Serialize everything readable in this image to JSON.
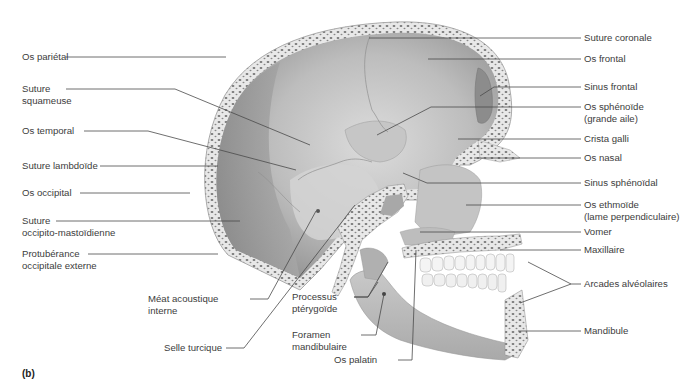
{
  "figure": {
    "panel_label": "(b)"
  },
  "labels_left": [
    {
      "id": "os-parietal",
      "lines": [
        "Os pariétal"
      ]
    },
    {
      "id": "suture-squameuse",
      "lines": [
        "Suture",
        "squameuse"
      ]
    },
    {
      "id": "os-temporal",
      "lines": [
        "Os temporal"
      ]
    },
    {
      "id": "suture-lambdoide",
      "lines": [
        "Suture lambdoïde"
      ]
    },
    {
      "id": "os-occipital",
      "lines": [
        "Os occipital"
      ]
    },
    {
      "id": "suture-occipito-mastoidienne",
      "lines": [
        "Suture",
        "occipito-mastoïdienne"
      ]
    },
    {
      "id": "protuberance-occipitale-externe",
      "lines": [
        "Protubérance",
        "occipitale externe"
      ]
    }
  ],
  "labels_bottom": [
    {
      "id": "meat-acoustique-interne",
      "lines": [
        "Méat acoustique",
        "interne"
      ]
    },
    {
      "id": "selle-turcique",
      "lines": [
        "Selle turcique"
      ]
    },
    {
      "id": "processus-pterygoide",
      "lines": [
        "Processus",
        "ptérygoïde"
      ]
    },
    {
      "id": "foramen-mandibulaire",
      "lines": [
        "Foramen",
        "mandibulaire"
      ]
    },
    {
      "id": "os-palatin",
      "lines": [
        "Os palatin"
      ]
    }
  ],
  "labels_right": [
    {
      "id": "suture-coronale",
      "lines": [
        "Suture coronale"
      ]
    },
    {
      "id": "os-frontal",
      "lines": [
        "Os frontal"
      ]
    },
    {
      "id": "sinus-frontal",
      "lines": [
        "Sinus frontal"
      ]
    },
    {
      "id": "os-sphenoide",
      "lines": [
        "Os sphénoïde",
        "(grande aile)"
      ]
    },
    {
      "id": "crista-galli",
      "lines": [
        "Crista galli"
      ]
    },
    {
      "id": "os-nasal",
      "lines": [
        "Os nasal"
      ]
    },
    {
      "id": "sinus-sphenoidal",
      "lines": [
        "Sinus sphénoïdal"
      ]
    },
    {
      "id": "os-ethmoide",
      "lines": [
        "Os ethmoïde",
        "(lame perpendiculaire)"
      ]
    },
    {
      "id": "vomer",
      "lines": [
        "Vomer"
      ]
    },
    {
      "id": "maxillaire",
      "lines": [
        "Maxillaire"
      ]
    },
    {
      "id": "arcades-alveolaires",
      "lines": [
        "Arcades alvéolaires"
      ]
    },
    {
      "id": "mandibule",
      "lines": [
        "Mandibule"
      ]
    }
  ],
  "colors": {
    "bone_dark": "#8a8a8a",
    "bone_mid": "#b4b4b4",
    "bone_light": "#d6d6d6",
    "cortical": "#ececec",
    "spongy_dot": "#6f6f6f",
    "teeth": "#f4f4f4",
    "leader_line": "#4a4a4a",
    "text": "#3c3c3c"
  }
}
